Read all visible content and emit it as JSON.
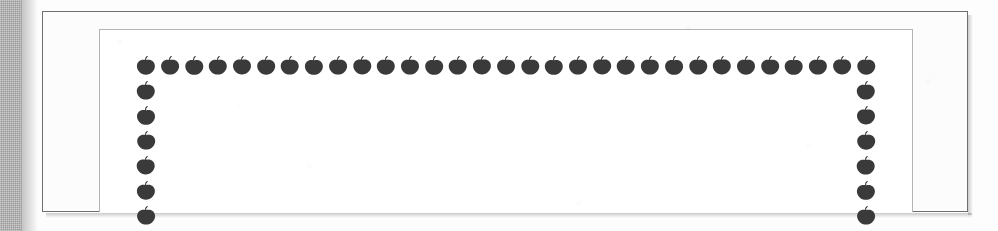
{
  "capture": {
    "width": 998,
    "height": 231,
    "kind": "scanned-page-fragment",
    "caption": ""
  },
  "colors": {
    "page_background": "#fcfcfc",
    "canvas_background": "#fdfdfd",
    "gutter_strip": "#9a9a9a",
    "outer_frame_border": "#6e6e6e",
    "inner_frame_border": "#b4b4b4",
    "margin_tint": "#f2f2f2",
    "blob_fill": "#3a3a3a",
    "blob_stem": "#2e2e2e",
    "shadow": "rgba(0,0,0,0.20)"
  },
  "gutter": {
    "name": "scanner-gutter-strip",
    "x": 0,
    "y": 0,
    "width": 22,
    "height": 231
  },
  "outer_frame": {
    "name": "page-border",
    "x": 42,
    "y": 11,
    "width": 926,
    "height": 201,
    "border_width": 1
  },
  "inner_frame": {
    "name": "text-block-border",
    "x": 99,
    "y": 29,
    "width": 814,
    "height": 183,
    "border_width": 1
  },
  "ornament": {
    "name": "apple-blob-border",
    "shape": "apple-blob-icon",
    "description": "row of dark rounded blobs with small stems forming an inverted-U border",
    "blob_width": 22,
    "blob_height": 20,
    "top_row": {
      "y": 66,
      "x_start": 146,
      "x_end": 866,
      "spacing": 24,
      "count": 31
    },
    "left_column": {
      "x": 146,
      "y_start": 66,
      "y_end": 216,
      "spacing": 25,
      "count": 7
    },
    "right_column": {
      "x": 866,
      "y_start": 66,
      "y_end": 216,
      "spacing": 25,
      "count": 7
    }
  },
  "content": {
    "interior_text": "",
    "interior_state": "blank"
  }
}
